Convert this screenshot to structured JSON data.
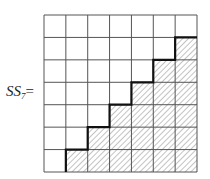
{
  "diagram": {
    "label_main": "SS",
    "label_subscript": "7",
    "label_equals": "=",
    "grid": {
      "rows": 7,
      "cols": 7,
      "shaded_description": "cells on or below the staircase (strictly below main anti-diagonal staircase), hatched",
      "staircase_cols_shaded_from_row": [
        6,
        5,
        4,
        3,
        2,
        1,
        0
      ]
    },
    "colors": {
      "grid_line": "#555555",
      "staircase": "#111111",
      "hatch": "#777777"
    }
  }
}
